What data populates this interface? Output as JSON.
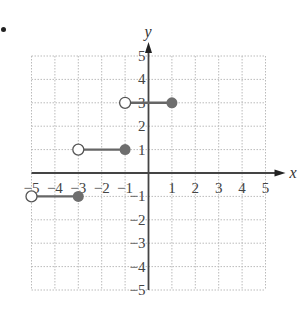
{
  "problem_marker": "•",
  "chart_data": {
    "type": "line",
    "title": "",
    "xlabel": "x",
    "ylabel": "y",
    "xlim": [
      -5,
      5
    ],
    "ylim": [
      -5,
      5
    ],
    "grid": true,
    "x_ticks": [
      "-5",
      "-4",
      "-3",
      "-2",
      "-1",
      "1",
      "2",
      "3",
      "4",
      "5"
    ],
    "y_ticks": [
      "5",
      "4",
      "3",
      "2",
      "1",
      "-1",
      "-2",
      "-3",
      "-4",
      "-5"
    ],
    "segments": [
      {
        "x_start": -5,
        "x_end": -3,
        "y": -1,
        "start_open": true,
        "end_closed": true
      },
      {
        "x_start": -3,
        "x_end": -1,
        "y": 1,
        "start_open": true,
        "end_closed": true
      },
      {
        "x_start": -1,
        "x_end": 1,
        "y": 3,
        "start_open": true,
        "end_closed": true
      }
    ],
    "colors": {
      "axis": "#444444",
      "grid": "#bbbbbb",
      "segment": "#666666",
      "closed_dot": "#6e6e6e",
      "open_dot_fill": "#ffffff"
    }
  }
}
